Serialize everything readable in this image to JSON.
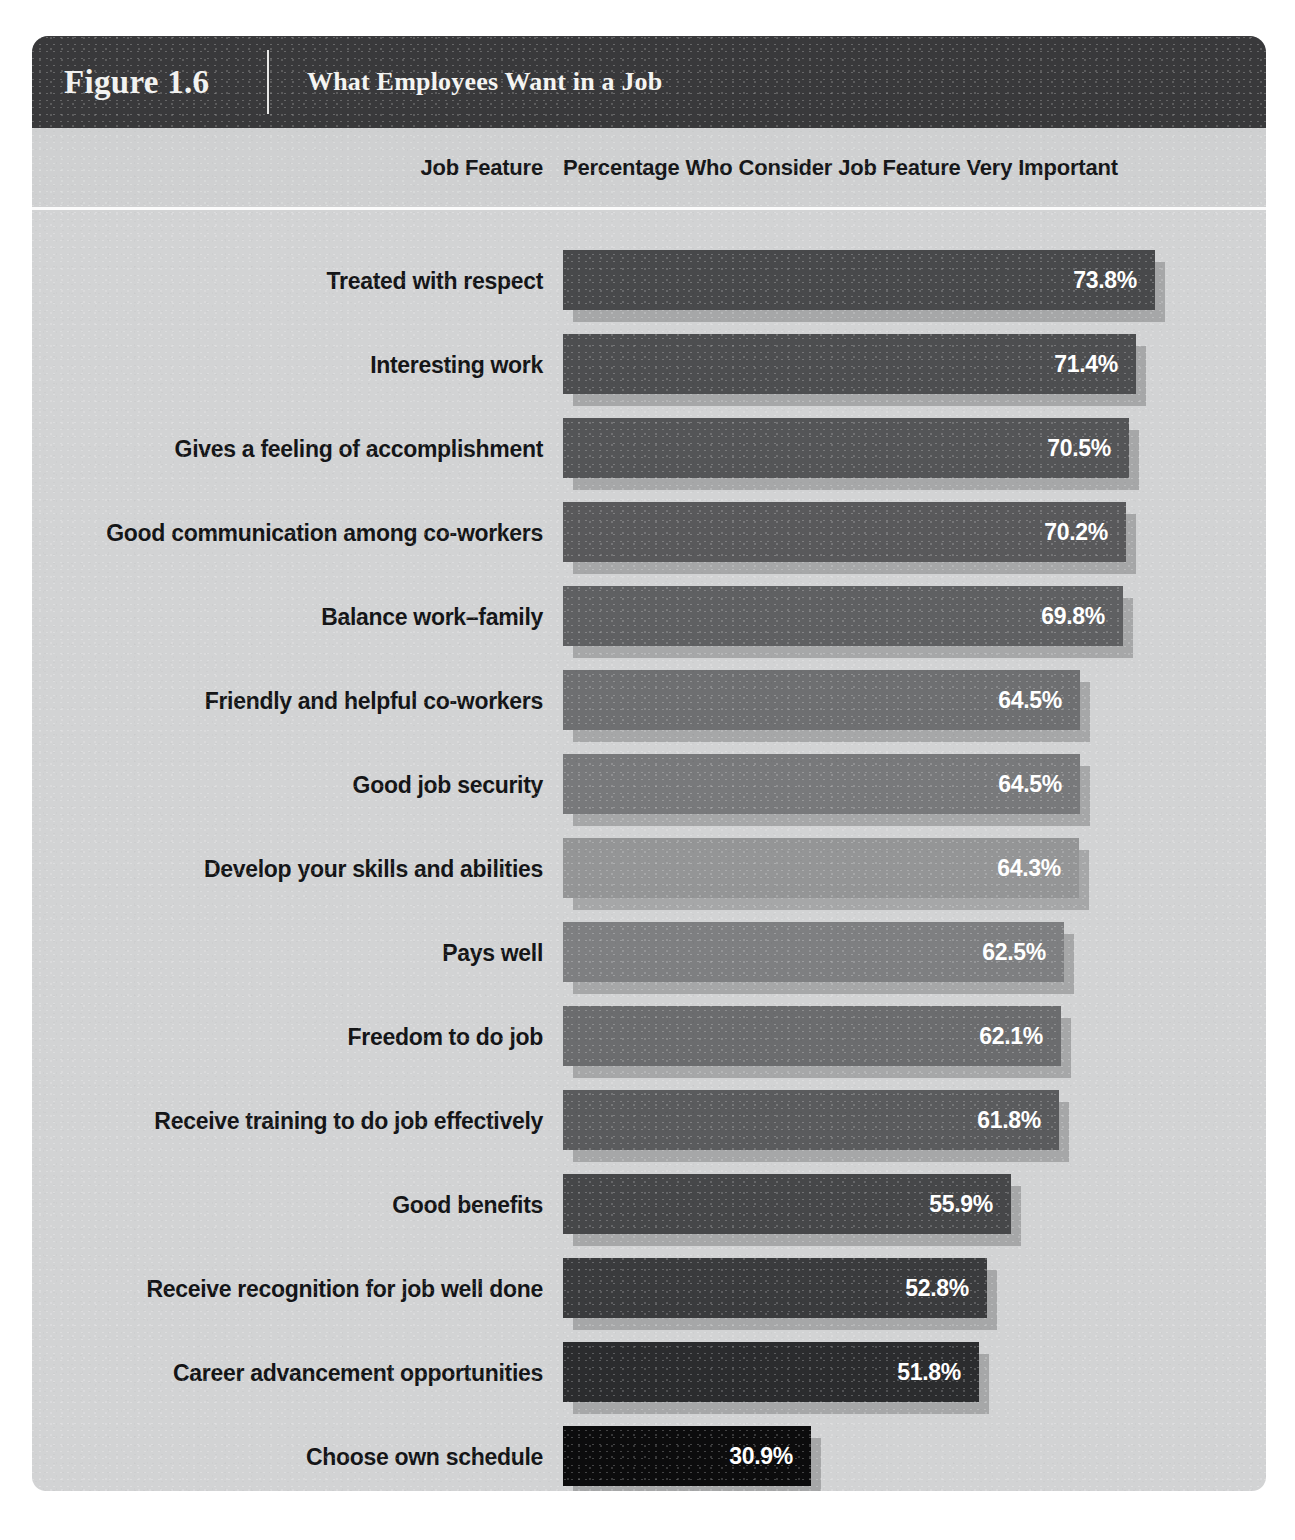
{
  "figure": {
    "number": "Figure 1.6",
    "title": "What Employees Want in a Job"
  },
  "columns": {
    "feature": "Job Feature",
    "percentage": "Percentage Who Consider Job Feature Very Important"
  },
  "chart_data": {
    "type": "bar",
    "orientation": "horizontal",
    "title": "What Employees Want in a Job",
    "xlabel": "Percentage Who Consider Job Feature Very Important",
    "ylabel": "Job Feature",
    "xlim": [
      0,
      80
    ],
    "grid": false,
    "legend": "none",
    "value_suffix": "%",
    "categories": [
      "Treated with respect",
      "Interesting work",
      "Gives a feeling of accomplishment",
      "Good communication among co-workers",
      "Balance work–family",
      "Friendly and helpful co-workers",
      "Good job security",
      "Develop your skills and abilities",
      "Pays well",
      "Freedom to do job",
      "Receive training to do job effectively",
      "Good benefits",
      "Receive recognition for job well done",
      "Career advancement opportunities",
      "Choose own schedule"
    ],
    "values": [
      73.8,
      71.4,
      70.5,
      70.2,
      69.8,
      64.5,
      64.5,
      64.3,
      62.5,
      62.1,
      61.8,
      55.9,
      52.8,
      51.8,
      30.9
    ],
    "value_labels": [
      "73.8%",
      "71.4%",
      "70.5%",
      "70.2%",
      "69.8%",
      "64.5%",
      "64.5%",
      "64.3%",
      "62.5%",
      "62.1%",
      "61.8%",
      "55.9%",
      "52.8%",
      "51.8%",
      "30.9%"
    ],
    "bar_colors": [
      "#48494b",
      "#4d4e50",
      "#545557",
      "#59595b",
      "#5f6062",
      "#6e6f71",
      "#78797b",
      "#949596",
      "#7e7f81",
      "#6b6c6e",
      "#5a5b5d",
      "#464749",
      "#3a3b3d",
      "#2b2c2e",
      "#0c0c0d"
    ]
  },
  "theme": {
    "header_bg": "#3a3a3c",
    "card_bg": "#d2d3d4",
    "shadow": "#a6a7a8",
    "label_color": "#141517",
    "value_color": "#ffffff"
  }
}
